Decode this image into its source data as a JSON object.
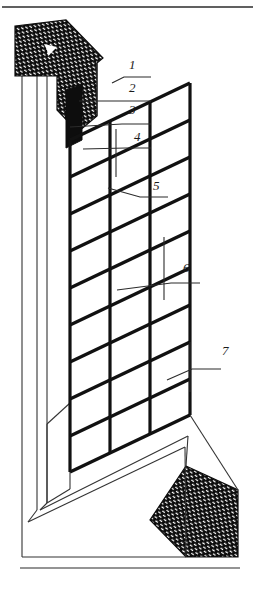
{
  "figure": {
    "type": "technical-line-drawing",
    "width": 255,
    "height": 591,
    "background_color": "#ffffff",
    "line_color": "#111111",
    "hatch_fill_color": "#0d0d0d",
    "hatch_dash_color": "#ffffff"
  },
  "top_rule": {
    "name": "top-border-rule",
    "y": 7
  },
  "bottom_rule": {
    "name": "bottom-border-rule",
    "y": 568
  },
  "callouts": [
    {
      "id": "1",
      "label": "1",
      "text_x": 129,
      "text_y": 69,
      "leader": "M112,83 L124,77 L151,77"
    },
    {
      "id": "2",
      "label": "2",
      "text_x": 129,
      "text_y": 92,
      "leader": "M79,101 L126,101 L151,101"
    },
    {
      "id": "3",
      "label": "3",
      "text_x": 129,
      "text_y": 114,
      "leader": "M70,127 L122,124 L151,124"
    },
    {
      "id": "4",
      "label": "4",
      "text_x": 134,
      "text_y": 141,
      "leader": "M83,149 L126,148 L151,148"
    },
    {
      "id": "5",
      "label": "5",
      "text_x": 153,
      "text_y": 190,
      "leader": "M108,188 L140,197 L168,197"
    },
    {
      "id": "6",
      "label": "6",
      "text_x": 183,
      "text_y": 272,
      "leader": "M117,290 L171,283 L200,283"
    },
    {
      "id": "7",
      "label": "7",
      "text_x": 222,
      "text_y": 355,
      "leader": "M167,380 L192,369 L221,369"
    }
  ],
  "pointer_ticks": [
    {
      "name": "tick-4",
      "x": 116,
      "y1": 129,
      "y2": 177
    },
    {
      "name": "tick-6",
      "x": 164,
      "y1": 237,
      "y2": 300
    },
    {
      "name": "tick-7",
      "x": 190,
      "y1": 342,
      "y2": 392
    }
  ],
  "mesh": {
    "name": "reinforcing-mesh",
    "vertical_count": 4,
    "horizontal_count": 9,
    "stroke_width": 3.2
  },
  "hatch_regions": [
    {
      "name": "upper-left-masonry-wedge"
    },
    {
      "name": "lower-right-masonry-wedge"
    }
  ],
  "arrow_marker": {
    "name": "section-arrow-marker"
  }
}
